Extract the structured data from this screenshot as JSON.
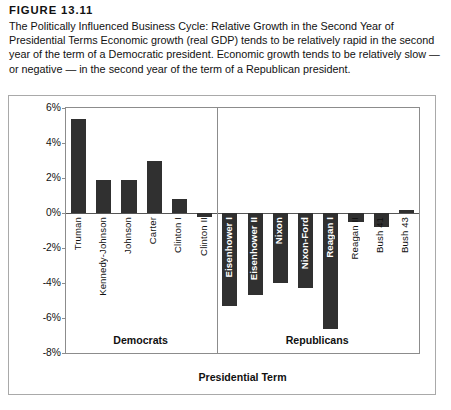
{
  "figure": {
    "number": "FIGURE 13.11",
    "caption": "The Politically Influenced Business Cycle: Relative Growth in the Second Year of Presidential Terms Economic growth (real GDP) tends to be relatively rapid in the second year of the term of a Democratic president. Economic growth tends to be relatively slow — or negative — in the second year of the term of a Republican president."
  },
  "chart_data": {
    "type": "bar",
    "title": "",
    "xlabel": "Presidential Term",
    "ylabel": "Second-Year Growth Minus Average Growth",
    "ylim": [
      -8,
      6
    ],
    "yticks": [
      6,
      4,
      2,
      0,
      -2,
      -4,
      -6,
      -8
    ],
    "ytick_labels": [
      "6%",
      "4%",
      "2%",
      "0%",
      "-2%",
      "-4%",
      "-6%",
      "-8%"
    ],
    "grid": false,
    "legend": "none",
    "groups": [
      {
        "name": "Democrats",
        "label": "Democrats"
      },
      {
        "name": "Republicans",
        "label": "Republicans"
      }
    ],
    "categories": [
      "Truman",
      "Kennedy-Johnson",
      "Johnson",
      "Carter",
      "Clinton I",
      "Clinton II",
      "Eisenhower I",
      "Eisenhower II",
      "Nixon",
      "Nixon-Ford",
      "Reagan I",
      "Reagan II",
      "Bush 41",
      "Bush 43"
    ],
    "values": [
      5.4,
      1.9,
      1.9,
      3.0,
      0.8,
      -0.2,
      -5.3,
      -4.7,
      -4.0,
      -4.3,
      -6.6,
      -0.5,
      -0.8,
      0.2
    ],
    "bars": [
      {
        "label": "Truman",
        "value": 5.4,
        "group": "Democrats",
        "label_placement": "outside"
      },
      {
        "label": "Kennedy-Johnson",
        "value": 1.9,
        "group": "Democrats",
        "label_placement": "outside"
      },
      {
        "label": "Johnson",
        "value": 1.9,
        "group": "Democrats",
        "label_placement": "outside"
      },
      {
        "label": "Carter",
        "value": 3.0,
        "group": "Democrats",
        "label_placement": "outside"
      },
      {
        "label": "Clinton I",
        "value": 0.8,
        "group": "Democrats",
        "label_placement": "outside"
      },
      {
        "label": "Clinton II",
        "value": -0.2,
        "group": "Democrats",
        "label_placement": "outside"
      },
      {
        "label": "Eisenhower I",
        "value": -5.3,
        "group": "Republicans",
        "label_placement": "inside"
      },
      {
        "label": "Eisenhower II",
        "value": -4.7,
        "group": "Republicans",
        "label_placement": "inside"
      },
      {
        "label": "Nixon",
        "value": -4.0,
        "group": "Republicans",
        "label_placement": "inside"
      },
      {
        "label": "Nixon-Ford",
        "value": -4.3,
        "group": "Republicans",
        "label_placement": "inside"
      },
      {
        "label": "Reagan I",
        "value": -6.6,
        "group": "Republicans",
        "label_placement": "inside"
      },
      {
        "label": "Reagan II",
        "value": -0.5,
        "group": "Republicans",
        "label_placement": "outside"
      },
      {
        "label": "Bush 41",
        "value": -0.8,
        "group": "Republicans",
        "label_placement": "outside"
      },
      {
        "label": "Bush 43",
        "value": 0.2,
        "group": "Republicans",
        "label_placement": "outside"
      }
    ],
    "bar_color": "#303030",
    "axis_color": "#8c8c8c"
  }
}
